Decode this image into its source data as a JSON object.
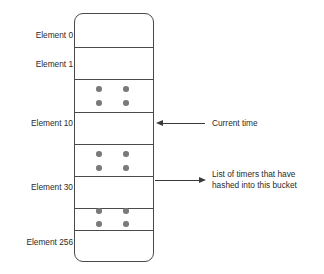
{
  "diagram": {
    "colors": {
      "outline": "#4a4a4a",
      "dot": "#7a7a7a",
      "arrow": "#3a3a3a",
      "text": "#2b2b2b",
      "background": "#ffffff"
    },
    "buckets": [
      {
        "label": "Element 0",
        "has_timers": false
      },
      {
        "label": "Element 1",
        "has_timers": false
      },
      {
        "label": "",
        "has_timers": true
      },
      {
        "label": "Element 10",
        "has_timers": false
      },
      {
        "label": "",
        "has_timers": true
      },
      {
        "label": "Element 30",
        "has_timers": false
      },
      {
        "label": "",
        "has_timers": true
      },
      {
        "label": "Element 256",
        "has_timers": false
      }
    ],
    "annotations": [
      {
        "name": "current-time",
        "text": "Current time",
        "direction": "left",
        "target_bucket_label": "Element 10"
      },
      {
        "name": "timer-list",
        "line1": "List of timers that have",
        "line2": "hashed into this bucket",
        "direction": "right",
        "target_bucket_label": "Element 30"
      }
    ]
  }
}
